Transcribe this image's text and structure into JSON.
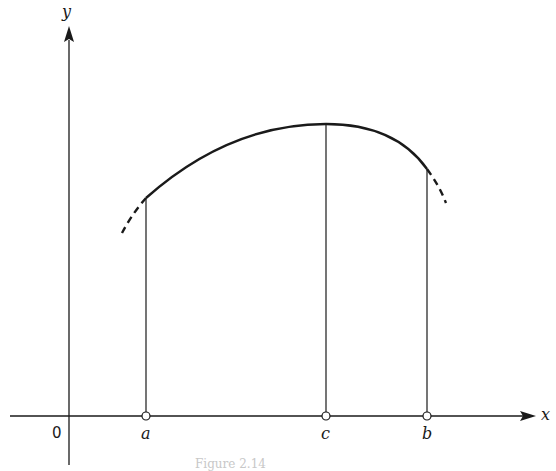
{
  "figure": {
    "axes": {
      "x_label": "x",
      "y_label": "y",
      "origin_label": "0"
    },
    "points": [
      {
        "label": "a"
      },
      {
        "label": "c"
      },
      {
        "label": "b"
      }
    ],
    "caption": "Figure 2.14"
  },
  "colors": {
    "ink": "#1a1a1a",
    "background": "#ffffff"
  }
}
